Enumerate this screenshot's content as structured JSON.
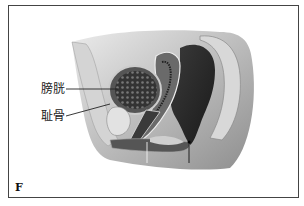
{
  "figure": {
    "panel_letter": "F",
    "labels": [
      {
        "id": "bladder",
        "text": "膀胱"
      },
      {
        "id": "pubic-bone",
        "text": "耻骨"
      }
    ],
    "colors": {
      "frame": "#444444",
      "background": "#ffffff",
      "dark_tissue": "#2a2a2a",
      "mid_tissue": "#8a8a8a",
      "light_tissue": "#d6d6d6"
    }
  }
}
